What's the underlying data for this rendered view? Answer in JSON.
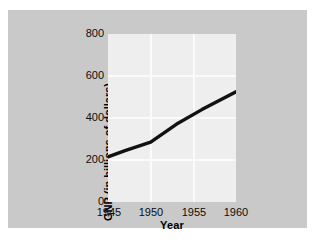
{
  "chart_data": {
    "type": "line",
    "title": "",
    "xlabel": "Year",
    "ylabel": "GNP (in billions of dollars)",
    "xlim": [
      1945,
      1960
    ],
    "ylim": [
      0,
      800
    ],
    "xticks": [
      "1945",
      "1950",
      "1955",
      "1960"
    ],
    "xtick_values": [
      1945,
      1950,
      1955,
      1960
    ],
    "yticks": [
      "0",
      "200",
      "400",
      "600",
      "800"
    ],
    "ytick_values": [
      0,
      200,
      400,
      600,
      800
    ],
    "grid": true,
    "legend": "none",
    "series": [
      {
        "name": "GNP",
        "color": "#111111",
        "x": [
          1945,
          1947,
          1950,
          1953,
          1956,
          1960
        ],
        "values": [
          215,
          245,
          285,
          370,
          440,
          525
        ]
      }
    ]
  },
  "figure": {
    "background_color": "#c9c9c9",
    "panel_color": "#eeeeee",
    "gridline_color": "#fbfbfb",
    "text_color": "#0c0c0c"
  }
}
